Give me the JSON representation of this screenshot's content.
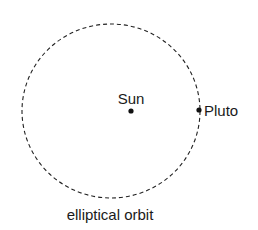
{
  "diagram": {
    "orbit": {
      "label": "elliptical orbit",
      "style": "dashed",
      "color": "#222222",
      "cx": 111,
      "cy": 111,
      "rx": 89,
      "ry": 87
    },
    "bodies": [
      {
        "name": "Sun",
        "label": "Sun",
        "x": 131,
        "y": 111
      },
      {
        "name": "Pluto",
        "label": "Pluto",
        "x": 199,
        "y": 110
      }
    ]
  }
}
